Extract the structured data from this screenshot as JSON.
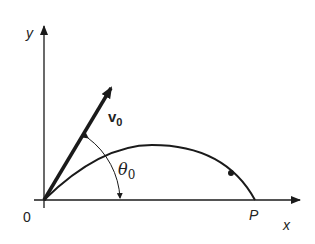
{
  "diagram": {
    "type": "projectile-trajectory",
    "axes": {
      "x_label": "x",
      "y_label": "y",
      "origin_label": "0"
    },
    "velocity_vector": {
      "label_main": "v",
      "label_sub": "0"
    },
    "angle": {
      "label_main": "θ",
      "label_sub": "0"
    },
    "landing_point": {
      "label": "P"
    },
    "colors": {
      "stroke": "#1a1a1a",
      "background": "#ffffff"
    }
  }
}
